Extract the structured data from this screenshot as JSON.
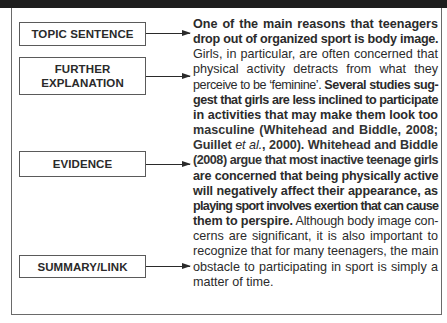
{
  "diagram": {
    "labels": [
      {
        "id": "topic",
        "text": "TOPIC SENTENCE"
      },
      {
        "id": "further",
        "line1": "FURTHER",
        "line2": "EXPLANATION"
      },
      {
        "id": "evidence",
        "text": "EVIDENCE"
      },
      {
        "id": "summary",
        "text": "SUMMARY/LINK"
      }
    ],
    "colors": {
      "band": "#1e1e1e",
      "border": "#6a6a6a",
      "text": "#2b2b2b"
    }
  },
  "paragraph": {
    "lines": [
      [
        {
          "t": "One of the main reasons that teenagers",
          "s": "b"
        }
      ],
      [
        {
          "t": "drop out of organized sport is body image.",
          "s": "b"
        }
      ],
      [
        {
          "t": "Girls, in particular, are often concerned that",
          "s": "n"
        }
      ],
      [
        {
          "t": "physical activity detracts from what they",
          "s": "n"
        }
      ],
      [
        {
          "t": "perceive to be ‘feminine’. ",
          "s": "n"
        },
        {
          "t": "Several studies sug-",
          "s": "b"
        }
      ],
      [
        {
          "t": "gest that girls are less inclined to participate",
          "s": "b"
        }
      ],
      [
        {
          "t": "in activities that may make them look too",
          "s": "b"
        }
      ],
      [
        {
          "t": "masculine (Whitehead and Biddle, 2008;",
          "s": "sb"
        }
      ],
      [
        {
          "t": "Guillet ",
          "s": "sb"
        },
        {
          "t": "et al.",
          "s": "i"
        },
        {
          "t": ", 2000). Whitehead and Biddle",
          "s": "sb"
        }
      ],
      [
        {
          "t": "(2008) argue that most inactive teenage girls",
          "s": "sb"
        }
      ],
      [
        {
          "t": "are concerned that being physically active",
          "s": "b"
        }
      ],
      [
        {
          "t": "will negatively affect their appearance, as",
          "s": "b"
        }
      ],
      [
        {
          "t": "playing sport involves exertion that can cause",
          "s": "b"
        }
      ],
      [
        {
          "t": "them to perspire.",
          "s": "b"
        },
        {
          "t": " Although body image con-",
          "s": "n"
        }
      ],
      [
        {
          "t": "cerns are significant, it is also important to",
          "s": "n"
        }
      ],
      [
        {
          "t": "recognize that for many teenagers, the main",
          "s": "n"
        }
      ],
      [
        {
          "t": "obstacle to participating in sport is simply a",
          "s": "n"
        }
      ],
      [
        {
          "t": "matter of time.",
          "s": "n"
        }
      ]
    ]
  }
}
